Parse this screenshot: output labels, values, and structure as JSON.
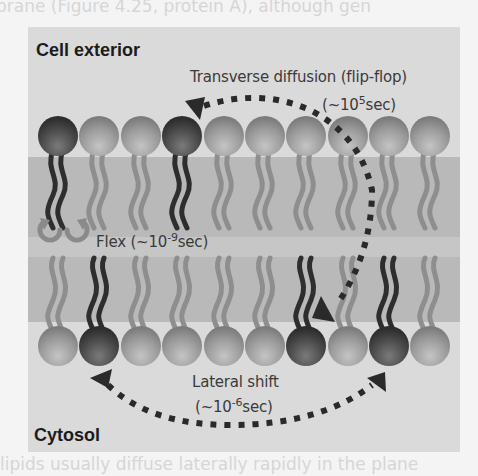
{
  "background_text": {
    "top_line": "brane (Figure 4.25, protein A), although gen",
    "bottom_line": "lipids usually diffuse laterally rapidly in the plane"
  },
  "diagram": {
    "regions": {
      "top": "Cell exterior",
      "bottom": "Cytosol"
    },
    "processes": {
      "transverse": {
        "label": "Transverse diffusion (flip-flop)",
        "time_prefix": "(~10",
        "time_exp": "5",
        "time_suffix": "sec)"
      },
      "flex": {
        "label_prefix": "Flex (~10",
        "time_exp": "-9",
        "time_suffix": "sec)"
      },
      "lateral": {
        "label": "Lateral shift",
        "time_prefix": "(~10",
        "time_exp": "-6",
        "time_suffix": "sec)"
      }
    },
    "leaflets": {
      "outer_head_count": 10,
      "outer_dark_indices": [
        0,
        3
      ],
      "inner_head_count": 10,
      "inner_dark_indices": [
        1,
        6,
        8
      ]
    },
    "colors": {
      "panel_bg": "#dadada",
      "hydrophobic_band": "#b9b9b9",
      "head_light": "#9a9a9a",
      "head_dark": "#4a4a4a",
      "tail_light": "#8e8e8e",
      "tail_dark": "#2e2e2e",
      "arrow": "#2a2a2a"
    }
  }
}
